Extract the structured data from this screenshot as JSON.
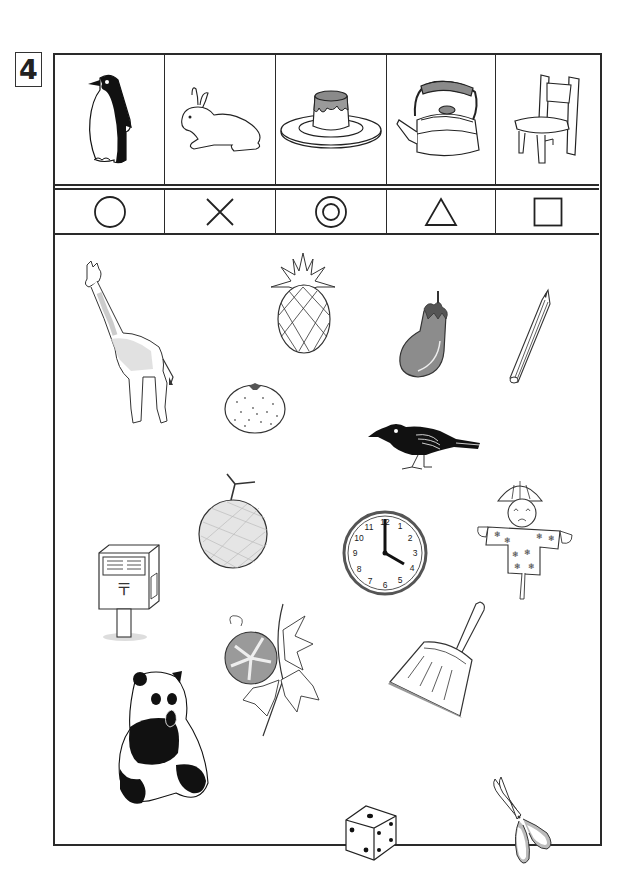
{
  "question": {
    "number": "4"
  },
  "key_table": {
    "columns": [
      {
        "picture": "penguin",
        "symbol": "circle",
        "symbol_glyph": "○"
      },
      {
        "picture": "rabbit",
        "symbol": "cross",
        "symbol_glyph": "×"
      },
      {
        "picture": "pudding",
        "symbol": "double-circle",
        "symbol_glyph": "◎"
      },
      {
        "picture": "kettle",
        "symbol": "triangle",
        "symbol_glyph": "△"
      },
      {
        "picture": "chair",
        "symbol": "square",
        "symbol_glyph": "□"
      }
    ]
  },
  "scene_items": [
    {
      "name": "giraffe"
    },
    {
      "name": "pineapple"
    },
    {
      "name": "eggplant"
    },
    {
      "name": "pencil"
    },
    {
      "name": "mandarin-orange"
    },
    {
      "name": "crow"
    },
    {
      "name": "melon"
    },
    {
      "name": "clock",
      "time": "4:00",
      "numbers": [
        "12",
        "1",
        "2",
        "3",
        "4",
        "5",
        "6",
        "7",
        "8",
        "9",
        "10",
        "11"
      ]
    },
    {
      "name": "scarecrow"
    },
    {
      "name": "mailbox",
      "mark": "〒"
    },
    {
      "name": "morning-glory"
    },
    {
      "name": "dustpan"
    },
    {
      "name": "panda"
    },
    {
      "name": "dice"
    },
    {
      "name": "scissors"
    }
  ],
  "colors": {
    "line": "#2a2a2a",
    "gray_fill": "#9a9a9a",
    "light_gray": "#d9d9d9",
    "background": "#ffffff"
  }
}
